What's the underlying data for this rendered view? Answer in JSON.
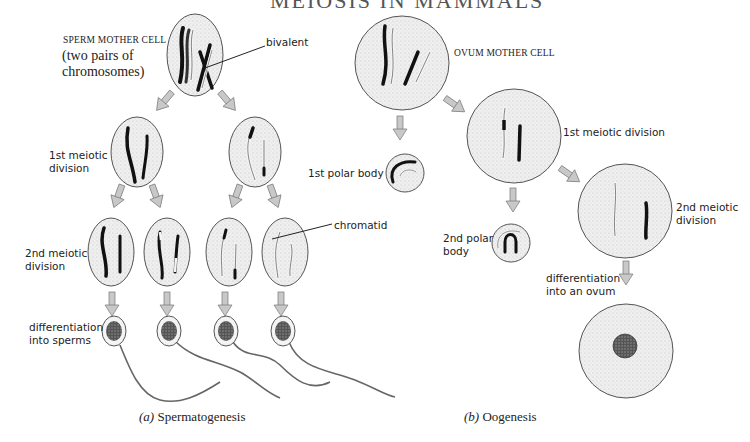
{
  "title_fragment": "MEIOSIS IN MAMMALS",
  "colors": {
    "cell_fill": "#ececec",
    "cell_stroke": "#555555",
    "arrow_fill": "#c8c8c8",
    "arrow_stroke": "#777777",
    "chromosome_dark": "#111111",
    "chromosome_light": "#f4f4f4",
    "text": "#222222"
  },
  "spermatogenesis": {
    "caption_prefix": "(a)",
    "caption_text": " Spermatogenesis",
    "mother_cell_label": "SPERM MOTHER CELL",
    "mother_cell_sublabel": "(two pairs of\nchromosomes)",
    "bivalent_label": "bivalent",
    "first_division_label": "1st meiotic\ndivision",
    "second_division_label": "2nd meiotic\ndivision",
    "chromatid_label": "chromatid",
    "differentiation_label": "differentiation\ninto sperms"
  },
  "oogenesis": {
    "caption_prefix": "(b)",
    "caption_text": " Oogenesis",
    "mother_cell_label": "OVUM MOTHER CELL",
    "first_division_label": "1st meiotic division",
    "first_polar_body_label": "1st polar body",
    "second_division_label": "2nd meiotic\ndivision",
    "second_polar_body_label": "2nd polar\nbody",
    "differentiation_label": "differentiation\ninto an ovum"
  }
}
